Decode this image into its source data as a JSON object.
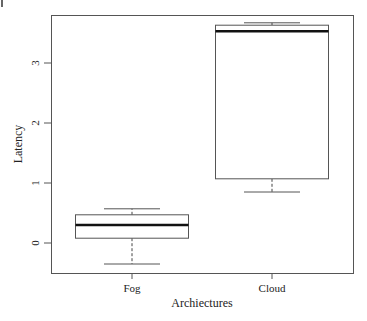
{
  "chart_data": {
    "type": "boxplot",
    "title": "",
    "xlabel": "Archiectures",
    "ylabel": "Latency",
    "categories": [
      "Fog",
      "Cloud"
    ],
    "series": [
      {
        "name": "Fog",
        "whisker_low": -0.35,
        "q1": 0.08,
        "median": 0.3,
        "q3": 0.47,
        "whisker_high": 0.57
      },
      {
        "name": "Cloud",
        "whisker_low": 0.85,
        "q1": 1.07,
        "median": 3.53,
        "q3": 3.63,
        "whisker_high": 3.67
      }
    ],
    "yticks": [
      0,
      1,
      2,
      3
    ],
    "ylim": [
      -0.5,
      3.8
    ],
    "grid": false,
    "legend": "none"
  },
  "labels": {
    "x_title": "Archiectures",
    "y_title": "Latency",
    "x_ticks": [
      "Fog",
      "Cloud"
    ],
    "y_ticks": [
      "0",
      "1",
      "2",
      "3"
    ]
  }
}
